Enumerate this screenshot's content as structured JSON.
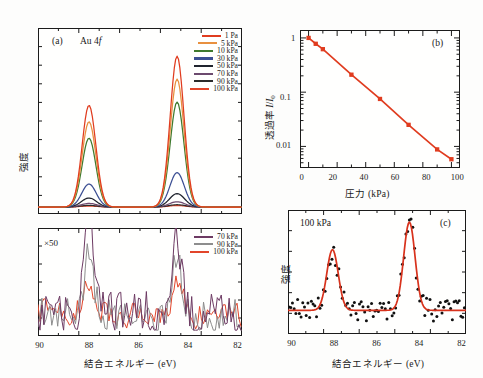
{
  "figure": {
    "background": "#fdfdfc",
    "axis_color": "#1b1b1b"
  },
  "panel_a": {
    "tag": "(a)",
    "sample_label_pre": "Au 4",
    "sample_label_italic": "f",
    "ylabel": "強度",
    "xlabel": "結合エネルギー (eV)",
    "xticks": [
      "90",
      "88",
      "86",
      "84",
      "82"
    ],
    "legend": [
      {
        "label": "1 Pa",
        "color": "#e03c1f"
      },
      {
        "label": "5 kPa",
        "color": "#e8903f"
      },
      {
        "label": "10 kPa",
        "color": "#3f7a2e"
      },
      {
        "label": "30 kPa",
        "color": "#3c4f93"
      },
      {
        "label": "50 kPa",
        "color": "#20242e"
      },
      {
        "label": "70 kPa",
        "color": "#6c4a6e"
      },
      {
        "label": "90 kPa",
        "color": "#2b2b2b"
      },
      {
        "label": "100 kPa",
        "color": "#e2452a"
      }
    ]
  },
  "panel_a_lower": {
    "scale_label": "×50",
    "legend": [
      {
        "label": "70 kPa",
        "color": "#6d3a63"
      },
      {
        "label": "90 kPa",
        "color": "#8d8d8d"
      },
      {
        "label": "100 kPa",
        "color": "#e2452a"
      }
    ]
  },
  "panel_b": {
    "tag": "(b)",
    "ylabel_pre": "透過率 ",
    "ylabel_i": "I",
    "ylabel_mid": "/",
    "ylabel_i2": "I",
    "ylabel_sub": "0",
    "xlabel": "圧力 (kPa)",
    "xticks": [
      "0",
      "20",
      "40",
      "60",
      "80",
      "100"
    ],
    "yticks": [
      "1",
      "0.1",
      "0.01"
    ],
    "marker_color": "#e03c1f",
    "line_color": "#e03c1f"
  },
  "panel_c": {
    "tag": "(c)",
    "annotation": "100 kPa",
    "ylabel": "強度",
    "xlabel": "結合エネルギー (eV)",
    "xticks": [
      "90",
      "88",
      "86",
      "84",
      "82"
    ],
    "point_color": "#111111",
    "fit_color": "#d8321c"
  },
  "chart_data": [
    {
      "type": "line",
      "panel": "a",
      "title": "Au 4f XPS spectra vs ambient pressure",
      "xlabel": "結合エネルギー (eV)",
      "ylabel": "強度",
      "xlim": [
        90,
        81.2
      ],
      "ylim": [
        0,
        1.05
      ],
      "grid": false,
      "legend_position": "top-right",
      "peaks": [
        {
          "center": 87.8,
          "label": "Au 4f7/2 doublet component"
        },
        {
          "center": 84.0,
          "label": "Au 4f5/2 doublet component"
        }
      ],
      "series": [
        {
          "name": "1 Pa",
          "color": "#e03c1f",
          "peak1_height": 0.62,
          "peak2_height": 0.92,
          "width": 0.42
        },
        {
          "name": "5 kPa",
          "color": "#e8903f",
          "peak1_height": 0.52,
          "peak2_height": 0.78,
          "width": 0.42
        },
        {
          "name": "10 kPa",
          "color": "#3f7a2e",
          "peak1_height": 0.42,
          "peak2_height": 0.64,
          "width": 0.42
        },
        {
          "name": "30 kPa",
          "color": "#3c4f93",
          "peak1_height": 0.14,
          "peak2_height": 0.21,
          "width": 0.44
        },
        {
          "name": "50 kPa",
          "color": "#20242e",
          "peak1_height": 0.055,
          "peak2_height": 0.082,
          "width": 0.46
        },
        {
          "name": "70 kPa",
          "color": "#6c4a6e",
          "peak1_height": 0.022,
          "peak2_height": 0.032,
          "width": 0.48
        },
        {
          "name": "90 kPa",
          "color": "#2b2b2b",
          "peak1_height": 0.01,
          "peak2_height": 0.014,
          "width": 0.5
        },
        {
          "name": "100 kPa",
          "color": "#e2452a",
          "peak1_height": 0.006,
          "peak2_height": 0.009,
          "width": 0.5
        }
      ]
    },
    {
      "type": "line",
      "panel": "a-lower",
      "title": "Magnified (×50) high-pressure spectra",
      "xlabel": "結合エネルギー (eV)",
      "ylabel": "強度",
      "xlim": [
        90,
        81.2
      ],
      "annotation": "×50",
      "legend_position": "top-right",
      "series": [
        {
          "name": "70 kPa",
          "color": "#6d3a63",
          "noise_amplitude": 0.3,
          "peak1": 0.95,
          "peak2": 0.88
        },
        {
          "name": "90 kPa",
          "color": "#8d8d8d",
          "noise_amplitude": 0.22,
          "peak1": 0.6,
          "peak2": 0.6
        },
        {
          "name": "100 kPa",
          "color": "#e2452a",
          "noise_amplitude": 0.16,
          "peak1": 0.4,
          "peak2": 0.42
        }
      ]
    },
    {
      "type": "scatter",
      "panel": "b",
      "title": "Transmission vs pressure",
      "xlabel": "圧力 (kPa)",
      "ylabel": "透過率 I/I0",
      "xlim": [
        -6,
        106
      ],
      "ylim": [
        0.004,
        1.4
      ],
      "yscale": "log",
      "grid": false,
      "x": [
        0,
        5,
        10,
        30,
        50,
        70,
        90,
        100
      ],
      "y": [
        1.0,
        0.78,
        0.62,
        0.21,
        0.075,
        0.025,
        0.0088,
        0.0058
      ],
      "marker": "square",
      "marker_color": "#e03c1f",
      "line_color": "#e03c1f"
    },
    {
      "type": "scatter",
      "panel": "c",
      "title": "Au 4f spectrum at 100 kPa with fit",
      "xlabel": "結合エネルギー (eV)",
      "ylabel": "強度",
      "xlim": [
        90,
        81.2
      ],
      "annotation": "100 kPa",
      "grid": false,
      "fit_peaks": [
        {
          "center": 87.8,
          "height": 0.62,
          "width": 0.4
        },
        {
          "center": 84.0,
          "height": 0.9,
          "width": 0.4
        }
      ],
      "baseline": 0.16,
      "noise_amplitude": 0.1,
      "point_color": "#111111",
      "fit_color": "#d8321c"
    }
  ]
}
